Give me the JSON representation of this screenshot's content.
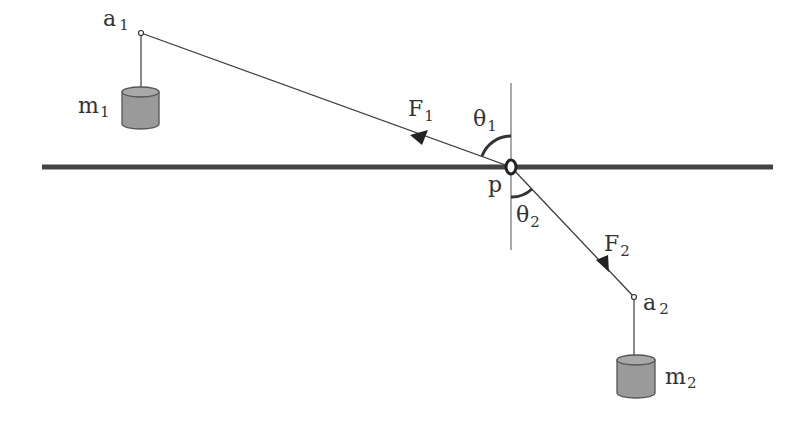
{
  "diagram": {
    "type": "physics-pulley-force-diagram",
    "colors": {
      "line": "#3a3a3a",
      "bar": "#444444",
      "weight_fill": "#9a9a9a",
      "weight_stroke": "#555555",
      "text": "#333333"
    },
    "labels": {
      "a1": "a",
      "a1_sub": "1",
      "a2": "a",
      "a2_sub": "2",
      "m1": "m",
      "m1_sub": "1",
      "m2": "m",
      "m2_sub": "2",
      "F1": "F",
      "F1_sub": "1",
      "F2": "F",
      "F2_sub": "2",
      "theta1": "θ",
      "theta1_sub": "1",
      "theta2": "θ",
      "theta2_sub": "2",
      "pivot": "p"
    },
    "elements": {
      "horizontal_bar": "thick horizontal line",
      "vertical_reference": "thin vertical line through p",
      "pivot": "ring at point p",
      "string_1": "from p to a1",
      "string_2": "from p to a2",
      "force_1": "arrow along string toward a1",
      "force_2": "arrow along string toward a2",
      "weight_1": "cylinder m1 hanging from a1",
      "weight_2": "cylinder m2 hanging from a2"
    }
  }
}
